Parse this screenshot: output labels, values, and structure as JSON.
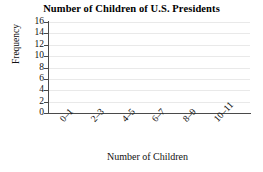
{
  "chart_data": {
    "type": "bar",
    "title": "Number of Children of U.S. Presidents",
    "subtitle": "",
    "xlabel": "Number of Children",
    "ylabel": "Frequency",
    "categories": [
      "0–1",
      "2–3",
      "4–5",
      "6–7",
      "8–9",
      "10–11"
    ],
    "values": [
      null,
      null,
      null,
      null,
      null,
      null
    ],
    "ylim": [
      0,
      16
    ],
    "y_ticks": [
      0,
      2,
      4,
      6,
      8,
      10,
      12,
      14,
      16
    ],
    "y_tick_labels": [
      "0",
      "2",
      "4",
      "6",
      "8",
      "10",
      "12",
      "14",
      "16"
    ],
    "grid": "horizontal",
    "legend": "none",
    "note": "Empty axes template: no bars plotted",
    "colors": {
      "axis": "#4a4a4a",
      "gridline": "#e9e9e9",
      "text": "#111111",
      "background": "#ffffff"
    }
  }
}
